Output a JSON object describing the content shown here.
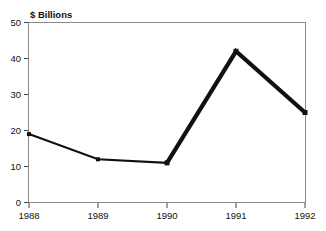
{
  "chart_data": {
    "type": "line",
    "title": "$ Billions",
    "xlabel": "",
    "ylabel": "",
    "categories": [
      "1988",
      "1989",
      "1990",
      "1991",
      "1992"
    ],
    "values": [
      19,
      12,
      11,
      42,
      25
    ],
    "series": [
      {
        "name": "$ Billions",
        "values": [
          19,
          12,
          11,
          42,
          25
        ]
      }
    ],
    "ylim": [
      0,
      50
    ],
    "yticks": [
      0,
      10,
      20,
      30,
      40,
      50
    ],
    "ytick_labels": [
      "0",
      "10",
      "20",
      "30",
      "40",
      "50"
    ],
    "xtick_labels": [
      "1988",
      "1989",
      "1990",
      "1991",
      "1992"
    ],
    "grid": false,
    "legend": false,
    "legend_position": "none",
    "line_color": "#111111",
    "marker": "square",
    "frame_color": "#8a8a8a",
    "background": "#ffffff"
  },
  "axes": {
    "y": {
      "ticks": [
        {
          "label": "50",
          "value": 50
        },
        {
          "label": "40",
          "value": 40
        },
        {
          "label": "30",
          "value": 30
        },
        {
          "label": "20",
          "value": 20
        },
        {
          "label": "10",
          "value": 10
        },
        {
          "label": "0",
          "value": 0
        }
      ]
    },
    "x": {
      "ticks": [
        {
          "label": "1988",
          "value": 1988
        },
        {
          "label": "1989",
          "value": 1989
        },
        {
          "label": "1990",
          "value": 1990
        },
        {
          "label": "1991",
          "value": 1991
        },
        {
          "label": "1992",
          "value": 1992
        }
      ]
    }
  },
  "points": [
    {
      "x_label": "1988",
      "y_value": "19"
    },
    {
      "x_label": "1989",
      "y_value": "12"
    },
    {
      "x_label": "1990",
      "y_value": "11"
    },
    {
      "x_label": "1991",
      "y_value": "42"
    },
    {
      "x_label": "1992",
      "y_value": "25"
    }
  ]
}
